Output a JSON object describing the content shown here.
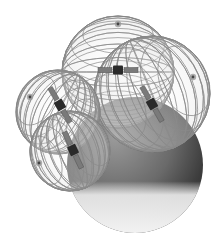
{
  "illustration": {
    "subject": "satellite-coverage-spheres-around-earth",
    "palette": {
      "background": "#ffffff",
      "grid_line": "#8a8a8a",
      "grid_line_dark": "#555555",
      "earth_dark": "#3a3a3a",
      "earth_mid": "#8c8c8c",
      "earth_light": "#e2e2e2",
      "satellite_body": "#2a2a2a",
      "solar_panel": "#7a7a7a"
    },
    "earth": {
      "cx": 135,
      "cy": 165,
      "r": 68
    },
    "spheres": [
      {
        "name": "top",
        "cx": 118,
        "cy": 72,
        "r": 56,
        "pole_x": 118,
        "pole_y": 24
      },
      {
        "name": "right",
        "cx": 152,
        "cy": 94,
        "r": 58,
        "pole_x": 193,
        "pole_y": 77
      },
      {
        "name": "left",
        "cx": 58,
        "cy": 112,
        "r": 42,
        "pole_x": 30,
        "pole_y": 97
      },
      {
        "name": "front",
        "cx": 70,
        "cy": 151,
        "r": 40,
        "pole_x": 39,
        "pole_y": 163
      }
    ],
    "satellites": [
      {
        "name": "sat-top",
        "x": 118,
        "y": 70,
        "angle": 0
      },
      {
        "name": "sat-right",
        "x": 152,
        "y": 104,
        "angle": 60
      },
      {
        "name": "sat-left",
        "x": 60,
        "y": 105,
        "angle": 60
      },
      {
        "name": "sat-front",
        "x": 73,
        "y": 150,
        "angle": 65
      }
    ]
  }
}
